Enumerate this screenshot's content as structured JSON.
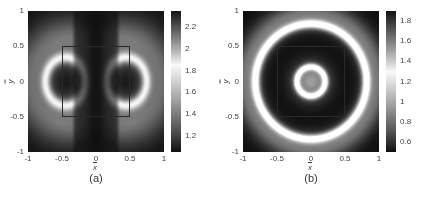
{
  "figure": {
    "panels": [
      {
        "caption": "(a)",
        "xlabel": "x",
        "ylabel": "y"
      },
      {
        "caption": "(b)",
        "xlabel": "x",
        "ylabel": "y"
      }
    ],
    "x_ticks": [
      "-1",
      "-0.5",
      "0",
      "0.5",
      "1"
    ],
    "y_ticks": [
      "1",
      "0.5",
      "0",
      "-0.5",
      "-1"
    ]
  },
  "chart_data": [
    {
      "type": "heatmap",
      "title": "",
      "caption": "(a)",
      "xlabel": "x̄",
      "ylabel": "ȳ",
      "xlim": [
        -1,
        1
      ],
      "ylim": [
        -1,
        1
      ],
      "x_ticks": [
        -1,
        -0.5,
        0,
        0.5,
        1
      ],
      "y_ticks": [
        -1,
        -0.5,
        0,
        0.5,
        1
      ],
      "colorbar": {
        "range": [
          1.05,
          2.35
        ],
        "ticks": [
          1.2,
          1.4,
          1.6,
          1.8,
          2,
          2.2
        ],
        "tick_labels": [
          "1.2",
          "1.4",
          "1.6",
          "1.8",
          "2",
          "2.2"
        ],
        "colormap": "dark-light-dark (peak brightness near 1.85)"
      },
      "pattern": "two D-shaped lobes centered at x=±0.45, y=0 with dark cores, bright rims, lighter halo; dark vertical band at x=0 and dark corners",
      "annotation_box": {
        "x": [
          -0.5,
          0.5
        ],
        "y": [
          -0.5,
          0.5
        ]
      },
      "legend": null,
      "grid": false
    },
    {
      "type": "heatmap",
      "title": "",
      "caption": "(b)",
      "xlabel": "x̄",
      "ylabel": "ȳ",
      "xlim": [
        -1,
        1
      ],
      "ylim": [
        -1,
        1
      ],
      "x_ticks": [
        -1,
        -0.5,
        0,
        0.5,
        1
      ],
      "y_ticks": [
        -1,
        -0.5,
        0,
        0.5,
        1
      ],
      "colorbar": {
        "range": [
          0.5,
          1.9
        ],
        "ticks": [
          0.6,
          0.8,
          1,
          1.2,
          1.4,
          1.6,
          1.8
        ],
        "tick_labels": [
          "0.6",
          "0.8",
          "1",
          "1.2",
          "1.4",
          "1.6",
          "1.8"
        ],
        "colormap": "dark-light-dark (peak brightness near 1.3)"
      },
      "pattern": "concentric rings centered at origin: grey center, bright ring r≈0.2, dark band r≈0.3-0.7, bright ring r≈0.82, dark corners",
      "annotation_box": {
        "x": [
          -0.5,
          0.5
        ],
        "y": [
          -0.5,
          0.5
        ]
      },
      "legend": null,
      "grid": false
    }
  ]
}
